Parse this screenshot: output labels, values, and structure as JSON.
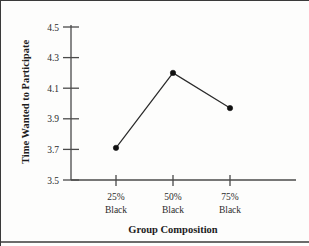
{
  "chart_data": {
    "type": "line",
    "title": "",
    "xlabel": "Group Composition",
    "ylabel": "Time Wanted to Participate",
    "categories": [
      "25%\nBlack",
      "50%\nBlack",
      "75%\nBlack"
    ],
    "category_lines": [
      {
        "top": "25%",
        "bottom": "Black"
      },
      {
        "top": "50%",
        "bottom": "Black"
      },
      {
        "top": "75%",
        "bottom": "Black"
      }
    ],
    "values": [
      3.71,
      4.2,
      3.97
    ],
    "ylim": [
      3.5,
      4.5
    ],
    "yticks": [
      3.5,
      3.7,
      3.9,
      4.1,
      4.3,
      4.5
    ],
    "ytick_labels": [
      "3.5",
      "3.7",
      "3.9",
      "4.1",
      "4.3",
      "4.5"
    ],
    "grid": false,
    "legend": "none",
    "series": [
      {
        "name": "Time Wanted to Participate",
        "values": [
          3.71,
          4.2,
          3.97
        ],
        "marker": "filled-circle",
        "color": "#111111"
      }
    ]
  },
  "axis": {
    "y_title": "Time Wanted to Participate",
    "x_title": "Group Composition"
  },
  "colors": {
    "line": "#2a2a2a",
    "marker": "#111111",
    "axis": "#4a4a4a",
    "text": "#2b2b2b",
    "background": "#fdfdfc"
  }
}
